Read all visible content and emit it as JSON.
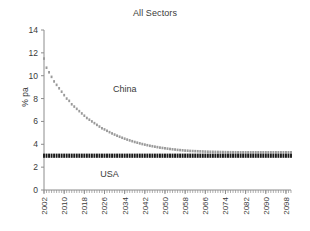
{
  "chart_data": {
    "type": "line",
    "title": "All Sectors",
    "xlabel": "",
    "ylabel": "% pa",
    "xlim": [
      2002,
      2100
    ],
    "ylim": [
      0,
      14
    ],
    "ytick_step": 2,
    "xtick_step": 8,
    "minor_xtick_step": 1,
    "grid": false,
    "legend": "inline annotations",
    "yticks": [
      0,
      2,
      4,
      6,
      8,
      10,
      12,
      14
    ],
    "xticks": [
      2002,
      2010,
      2018,
      2026,
      2034,
      2042,
      2050,
      2058,
      2066,
      2074,
      2082,
      2090,
      2098
    ],
    "annotations": [
      {
        "text": "China",
        "x": 2034,
        "y": 8.6
      },
      {
        "text": "USA",
        "x": 2028,
        "y": 1.1
      }
    ],
    "colors": {
      "china": "#9a9a9a",
      "usa": "#1a1a1a",
      "axis": "#8c8c8c",
      "text": "#3a3a3a"
    },
    "series": [
      {
        "name": "China",
        "color": "#9a9a9a",
        "marker": "square",
        "x": [
          2002,
          2003,
          2004,
          2005,
          2006,
          2007,
          2008,
          2009,
          2010,
          2011,
          2012,
          2013,
          2014,
          2015,
          2016,
          2017,
          2018,
          2019,
          2020,
          2021,
          2022,
          2023,
          2024,
          2025,
          2026,
          2027,
          2028,
          2029,
          2030,
          2031,
          2032,
          2033,
          2034,
          2035,
          2036,
          2037,
          2038,
          2039,
          2040,
          2041,
          2042,
          2043,
          2044,
          2045,
          2046,
          2047,
          2048,
          2049,
          2050,
          2051,
          2052,
          2053,
          2054,
          2055,
          2056,
          2057,
          2058,
          2059,
          2060,
          2061,
          2062,
          2063,
          2064,
          2065,
          2066,
          2067,
          2068,
          2069,
          2070,
          2071,
          2072,
          2073,
          2074,
          2075,
          2076,
          2077,
          2078,
          2079,
          2080,
          2081,
          2082,
          2083,
          2084,
          2085,
          2086,
          2087,
          2088,
          2089,
          2090,
          2091,
          2092,
          2093,
          2094,
          2095,
          2096,
          2097,
          2098,
          2099,
          2100
        ],
        "values": [
          11.5,
          10.7,
          10.3,
          9.9,
          9.5,
          9.2,
          8.9,
          8.6,
          8.3,
          8.0,
          7.8,
          7.5,
          7.3,
          7.1,
          6.9,
          6.7,
          6.5,
          6.3,
          6.15,
          6.0,
          5.85,
          5.7,
          5.55,
          5.4,
          5.3,
          5.18,
          5.06,
          4.95,
          4.85,
          4.75,
          4.66,
          4.57,
          4.49,
          4.41,
          4.34,
          4.27,
          4.2,
          4.14,
          4.08,
          4.02,
          3.97,
          3.92,
          3.87,
          3.83,
          3.79,
          3.75,
          3.71,
          3.68,
          3.65,
          3.62,
          3.59,
          3.56,
          3.54,
          3.51,
          3.49,
          3.47,
          3.45,
          3.44,
          3.42,
          3.41,
          3.4,
          3.39,
          3.38,
          3.37,
          3.36,
          3.35,
          3.345,
          3.34,
          3.335,
          3.33,
          3.325,
          3.32,
          3.315,
          3.31,
          3.308,
          3.305,
          3.303,
          3.3,
          3.3,
          3.3,
          3.3,
          3.3,
          3.3,
          3.3,
          3.3,
          3.3,
          3.3,
          3.3,
          3.3,
          3.3,
          3.3,
          3.3,
          3.3,
          3.3,
          3.3,
          3.3,
          3.3,
          3.3,
          3.3
        ]
      },
      {
        "name": "USA",
        "color": "#1a1a1a",
        "marker": "square",
        "constant_value": 3.0,
        "x": [
          2002,
          2003,
          2004,
          2005,
          2006,
          2007,
          2008,
          2009,
          2010,
          2011,
          2012,
          2013,
          2014,
          2015,
          2016,
          2017,
          2018,
          2019,
          2020,
          2021,
          2022,
          2023,
          2024,
          2025,
          2026,
          2027,
          2028,
          2029,
          2030,
          2031,
          2032,
          2033,
          2034,
          2035,
          2036,
          2037,
          2038,
          2039,
          2040,
          2041,
          2042,
          2043,
          2044,
          2045,
          2046,
          2047,
          2048,
          2049,
          2050,
          2051,
          2052,
          2053,
          2054,
          2055,
          2056,
          2057,
          2058,
          2059,
          2060,
          2061,
          2062,
          2063,
          2064,
          2065,
          2066,
          2067,
          2068,
          2069,
          2070,
          2071,
          2072,
          2073,
          2074,
          2075,
          2076,
          2077,
          2078,
          2079,
          2080,
          2081,
          2082,
          2083,
          2084,
          2085,
          2086,
          2087,
          2088,
          2089,
          2090,
          2091,
          2092,
          2093,
          2094,
          2095,
          2096,
          2097,
          2098,
          2099,
          2100
        ],
        "values": [
          3.0,
          3.0,
          3.0,
          3.0,
          3.0,
          3.0,
          3.0,
          3.0,
          3.0,
          3.0,
          3.0,
          3.0,
          3.0,
          3.0,
          3.0,
          3.0,
          3.0,
          3.0,
          3.0,
          3.0,
          3.0,
          3.0,
          3.0,
          3.0,
          3.0,
          3.0,
          3.0,
          3.0,
          3.0,
          3.0,
          3.0,
          3.0,
          3.0,
          3.0,
          3.0,
          3.0,
          3.0,
          3.0,
          3.0,
          3.0,
          3.0,
          3.0,
          3.0,
          3.0,
          3.0,
          3.0,
          3.0,
          3.0,
          3.0,
          3.0,
          3.0,
          3.0,
          3.0,
          3.0,
          3.0,
          3.0,
          3.0,
          3.0,
          3.0,
          3.0,
          3.0,
          3.0,
          3.0,
          3.0,
          3.0,
          3.0,
          3.0,
          3.0,
          3.0,
          3.0,
          3.0,
          3.0,
          3.0,
          3.0,
          3.0,
          3.0,
          3.0,
          3.0,
          3.0,
          3.0,
          3.0,
          3.0,
          3.0,
          3.0,
          3.0,
          3.0,
          3.0,
          3.0,
          3.0,
          3.0,
          3.0,
          3.0,
          3.0,
          3.0,
          3.0,
          3.0,
          3.0,
          3.0,
          3.0
        ]
      }
    ]
  }
}
